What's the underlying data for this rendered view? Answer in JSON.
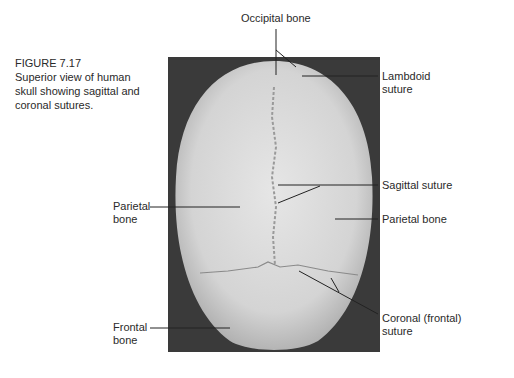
{
  "figure": {
    "number": "FIGURE 7.17",
    "caption": "Superior view of human skull showing sagittal and coronal sutures.",
    "caption_lines": [
      "Superior view of human",
      "skull showing sagittal and",
      "coronal sutures."
    ]
  },
  "labels": {
    "occipital": "Occipital bone",
    "lambdoid_1": "Lambdoid",
    "lambdoid_2": "suture",
    "sagittal": "Sagittal suture",
    "parietal_right": "Parietal bone",
    "parietal_left_1": "Parietal",
    "parietal_left_2": "bone",
    "frontal_1": "Frontal",
    "frontal_2": "bone",
    "coronal_1": "Coronal (frontal)",
    "coronal_2": "suture"
  },
  "colors": {
    "background": "#ffffff",
    "photo_bg": "#3a3a3a",
    "bone": "#d9d9d9",
    "text": "#2a2a2a",
    "leader": "#222222"
  }
}
